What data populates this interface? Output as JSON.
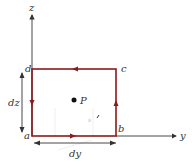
{
  "diagram": {
    "axes": {
      "vertical_label": "z",
      "horizontal_label": "y"
    },
    "corners": {
      "a": "a",
      "b": "b",
      "c": "c",
      "d": "d"
    },
    "point_label": "P",
    "dimensions": {
      "height_label": "dz",
      "width_label": "dy"
    },
    "colors": {
      "loop": "#8b1a1a",
      "axes": "#333333",
      "text": "#333333"
    },
    "circulation": "a→b→c→d→a (counterclockwise)"
  }
}
